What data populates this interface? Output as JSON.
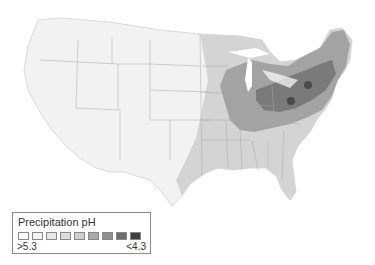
{
  "legend": {
    "title": "Precipitation pH",
    "low_label": ">5.3",
    "high_label": "<4.3",
    "swatch_colors": [
      "#ffffff",
      "#f4f4f4",
      "#e8e8e8",
      "#dcdcdc",
      "#cfcfcf",
      "#aaaaaa",
      "#8f8f8f",
      "#6e6e6e",
      "#3e3e3e"
    ]
  },
  "map": {
    "subject": "Contiguous United States precipitation acidity",
    "colors": {
      "land_light": "#f3f3f3",
      "land_mid": "#d2d2d2",
      "land_dark": "#9a9a9a",
      "land_darkest": "#6f6f6f",
      "hotspot": "#4a4a4a",
      "border": "#9c9c9c"
    }
  }
}
